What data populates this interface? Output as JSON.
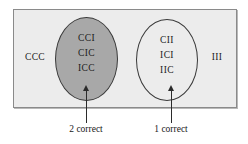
{
  "figure": {
    "name": "venn-diagram-guessing-outcomes",
    "sample_space_fill": "#ececec",
    "sample_space_border": "#8a8a8a",
    "regions": {
      "two_correct": {
        "label": "2 correct",
        "fill": "#a8a8a8",
        "shaded": "true",
        "outcomes": [
          "CCI",
          "CIC",
          "ICC"
        ]
      },
      "one_correct": {
        "label": "1 correct",
        "fill": "transparent",
        "shaded": "false",
        "outcomes": [
          "CII",
          "ICI",
          "IIC"
        ]
      }
    },
    "outside_outcomes": {
      "all_correct": "CCC",
      "none_correct": "III"
    }
  }
}
